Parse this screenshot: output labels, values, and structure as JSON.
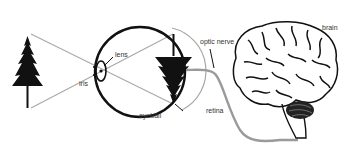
{
  "diagram": {
    "type": "anatomy-illustration",
    "labels": {
      "lens": "lens",
      "iris": "iris",
      "eyeball": "eyeball",
      "retina": "retina",
      "optic_nerve": "optic nerve",
      "brain": "brain"
    },
    "colors": {
      "ink": "#111111",
      "light_rays": "#a8a8a8",
      "nerve": "#9a9a9a",
      "label_text": "#333333"
    }
  }
}
